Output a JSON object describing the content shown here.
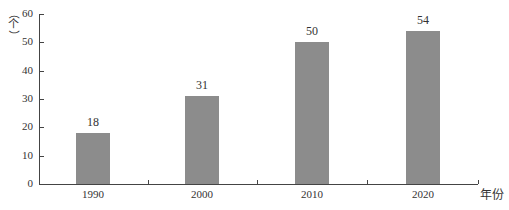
{
  "chart_data": {
    "type": "bar",
    "title": "",
    "categories": [
      "1990",
      "2000",
      "2010",
      "2020"
    ],
    "values": [
      18,
      31,
      50,
      54
    ],
    "data_labels": [
      "18",
      "31",
      "50",
      "54"
    ],
    "xlabel": "年份",
    "ylabel": "（个）",
    "ylim": [
      0,
      60
    ],
    "yticks": [
      "0",
      "10",
      "20",
      "30",
      "40",
      "50",
      "60"
    ],
    "grid": false,
    "legend": null,
    "bar_color": "#8c8c8c"
  },
  "axis": {
    "ylabel_chars": [
      "（",
      "个",
      "）"
    ],
    "xlabel": "年份"
  }
}
